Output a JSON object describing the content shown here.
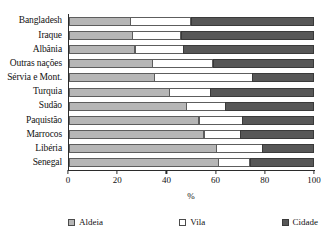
{
  "chart_data": {
    "type": "bar",
    "orientation": "horizontal",
    "stacked": true,
    "stack_total": 100,
    "title": "",
    "xlabel": "%",
    "ylabel": "",
    "xlim": [
      0,
      100
    ],
    "xticks": [
      0,
      20,
      40,
      60,
      80,
      100
    ],
    "xtick_labels": [
      "0",
      "20",
      "40",
      "60",
      "80",
      "100"
    ],
    "grid": false,
    "legend_position": "bottom",
    "categories": [
      "Bangladesh",
      "Iraque",
      "Albânia",
      "Outras nações",
      "Sérvia e Mont.",
      "Turquia",
      "Sudão",
      "Paquistão",
      "Marrocos",
      "Libéria",
      "Senegal"
    ],
    "series": [
      {
        "name": "Aldeia",
        "color": "#b6b6b6",
        "values": [
          25,
          26,
          27,
          34,
          35,
          41,
          48,
          53,
          55,
          60,
          61
        ]
      },
      {
        "name": "Vila",
        "color": "#ffffff",
        "values": [
          25,
          20,
          20,
          25,
          40,
          17,
          16,
          18,
          15,
          19,
          13
        ]
      },
      {
        "name": "Cidade",
        "color": "#575757",
        "values": [
          50,
          54,
          53,
          41,
          25,
          42,
          36,
          29,
          30,
          21,
          26
        ]
      }
    ],
    "cumulative_boundaries": [
      [
        25,
        50
      ],
      [
        26,
        46
      ],
      [
        27,
        47
      ],
      [
        34,
        59
      ],
      [
        35,
        75
      ],
      [
        41,
        58
      ],
      [
        48,
        64
      ],
      [
        53,
        71
      ],
      [
        55,
        70
      ],
      [
        60,
        79
      ],
      [
        61,
        74
      ]
    ]
  },
  "legend": {
    "items": [
      {
        "label": "Aldeia",
        "swatch": "legend-swatch-aldeia"
      },
      {
        "label": "Vila",
        "swatch": "legend-swatch-vila"
      },
      {
        "label": "Cidade",
        "swatch": "legend-swatch-cidade"
      }
    ]
  }
}
